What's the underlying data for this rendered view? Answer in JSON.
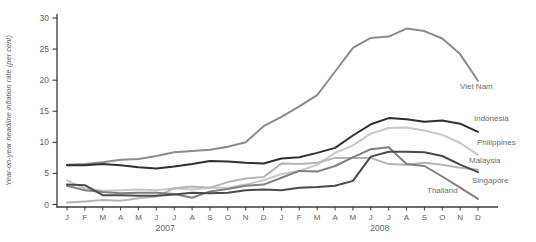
{
  "chart_data": {
    "type": "line",
    "title": "",
    "xlabel": "",
    "ylabel": "Year-on-year headline inflation rate (per cent)",
    "ylim": [
      0,
      30
    ],
    "yticks": [
      0,
      5,
      10,
      15,
      20,
      25,
      30
    ],
    "grid": false,
    "legend_position": "end-of-line-labels",
    "x_months": [
      "J",
      "F",
      "M",
      "A",
      "M",
      "J",
      "J",
      "A",
      "S",
      "O",
      "N",
      "D",
      "J",
      "F",
      "M",
      "A",
      "M",
      "J",
      "J",
      "A",
      "S",
      "O",
      "N",
      "D"
    ],
    "year_labels": [
      "2007",
      "2008"
    ],
    "axis_color": "#3a3a3a",
    "tick_text_color": "#5f5f5f",
    "series_label_color": "#6e6e6e",
    "series": [
      {
        "name": "Viet Nam",
        "color": "#8c8c8c",
        "values": [
          6.4,
          6.5,
          6.8,
          7.2,
          7.3,
          7.8,
          8.4,
          8.6,
          8.8,
          9.3,
          10.0,
          12.6,
          14.1,
          15.8,
          17.6,
          21.4,
          25.2,
          26.8,
          27.0,
          28.3,
          27.9,
          26.7,
          24.2,
          19.9
        ]
      },
      {
        "name": "Indonesia",
        "color": "#303030",
        "values": [
          6.3,
          6.3,
          6.5,
          6.3,
          6.0,
          5.8,
          6.1,
          6.5,
          7.0,
          6.9,
          6.7,
          6.6,
          7.4,
          7.6,
          8.3,
          9.1,
          11.1,
          12.9,
          13.9,
          13.7,
          13.3,
          13.5,
          13.0,
          11.7
        ]
      },
      {
        "name": "Philippines",
        "color": "#c8c8c8",
        "values": [
          3.9,
          2.6,
          2.2,
          2.3,
          2.4,
          2.3,
          2.6,
          2.4,
          2.7,
          2.7,
          3.2,
          3.9,
          4.9,
          5.4,
          6.4,
          8.3,
          9.5,
          11.4,
          12.3,
          12.4,
          11.9,
          11.2,
          9.9,
          8.0
        ]
      },
      {
        "name": "Malaysia",
        "color": "#4b4b4b",
        "values": [
          3.2,
          3.1,
          1.5,
          1.5,
          1.4,
          1.4,
          1.6,
          1.9,
          1.8,
          1.9,
          2.3,
          2.4,
          2.3,
          2.7,
          2.8,
          3.0,
          3.8,
          7.7,
          8.5,
          8.5,
          8.4,
          7.8,
          6.4,
          5.2
        ]
      },
      {
        "name": "Singapore",
        "color": "#b5b5b5",
        "values": [
          0.3,
          0.5,
          0.7,
          0.6,
          1.0,
          1.3,
          2.6,
          2.9,
          2.7,
          3.6,
          4.2,
          4.4,
          6.6,
          6.5,
          6.7,
          7.5,
          7.5,
          7.5,
          6.5,
          6.4,
          6.7,
          6.4,
          5.9,
          5.6
        ]
      },
      {
        "name": "Thailand",
        "color": "#808080",
        "values": [
          3.0,
          2.3,
          2.0,
          1.8,
          1.9,
          1.9,
          1.7,
          1.1,
          2.1,
          2.5,
          3.0,
          3.2,
          4.3,
          5.4,
          5.3,
          6.2,
          7.6,
          8.9,
          9.2,
          6.5,
          6.2,
          4.5,
          2.7,
          0.9
        ]
      }
    ]
  }
}
